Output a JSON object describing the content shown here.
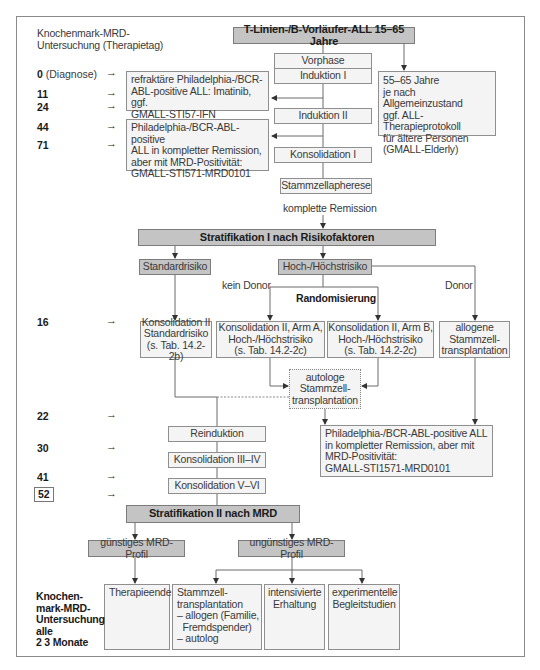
{
  "header": {
    "left_title": "Knochenmark-MRD-\nUntersuchung (Therapietag)",
    "main_title": "T-Linien-/B-Vorläufer-ALL 15–65 Jahre"
  },
  "days": [
    {
      "day": "0",
      "suffix": " (Diagnose)"
    },
    {
      "day": "11"
    },
    {
      "day": "24"
    },
    {
      "day": "44"
    },
    {
      "day": "71"
    },
    {
      "day": "16"
    },
    {
      "day": "22"
    },
    {
      "day": "30"
    },
    {
      "day": "41"
    },
    {
      "day": "52",
      "boxed": true
    }
  ],
  "arrow_glyph": "→",
  "phases": {
    "vorphase": "Vorphase",
    "induktion1": "Induktion I",
    "induktion2": "Induktion II",
    "konsolidation1": "Konsolidation I",
    "stammzellapherese": "Stammzellapherese",
    "reinduktion": "Reinduktion",
    "konsolidation3_4": "Konsolidation III–IV",
    "konsolidation5_6": "Konsolidation V–VI"
  },
  "side_boxes": {
    "refractory": "refraktäre Philadelphia-/BCR-\nABL-positive ALL: Imatinib, ggf.\nGMALL-STI57-IFN",
    "mrd_positive_left": "Philadelphia-/BCR-ABL-positive\nALL in kompletter Remission,\naber mit MRD-Positivität:\nGMALL-STI571-MRD0101",
    "elderly": "55–65 Jahre\nje nach Allgemeinzustand\nggf. ALL-Therapieprotokoll\nfür ältere Personen\n(GMALL-Elderly)",
    "mrd_positive_right": "Philadelphia-/BCR-ABL-positive ALL\nin kompletter Remission, aber mit\nMRD-Positivität:\nGMALL-STI1571-MRD0101"
  },
  "labels": {
    "komplette_remission": "komplette Remission",
    "kein_donor": "kein Donor",
    "donor": "Donor",
    "randomisierung": "Randomisierung"
  },
  "stratification1": {
    "title": "Stratifikation I nach Risikofaktoren",
    "standard": "Standardrisiko",
    "high": "Hoch-/Höchstrisiko",
    "kons2_std": "Konsolidation II\nStandardrisiko\n(s. Tab. 14.2-2b)",
    "kons2_armA": "Konsolidation II, Arm A,\nHoch-/Höchstrisiko\n(s. Tab. 14.2-2c)",
    "kons2_armB": "Konsolidation II, Arm B,\nHoch-/Höchstrisiko\n(s. Tab. 14.2-2c)",
    "allogene": "allogene\nStammzell-\ntransplantation",
    "autologe": "autologe\nStammzell-\ntransplantation"
  },
  "stratification2": {
    "title": "Stratifikation II nach MRD",
    "favorable": "günstiges MRD-Profil",
    "unfavorable": "ungünstiges MRD-Profil",
    "therapieende": "Therapieende",
    "stammzell": "Stammzell-\ntransplantation\n– allogen (Familie,\n  Fremdspender)\n– autolog",
    "intensivierte": "intensivierte\nErhaltung",
    "experimentelle": "experimentelle\nBegleitstudien"
  },
  "footer_note": "Knochen-\nmark-MRD-\nUntersuchung\nalle\n2   3 Monate"
}
